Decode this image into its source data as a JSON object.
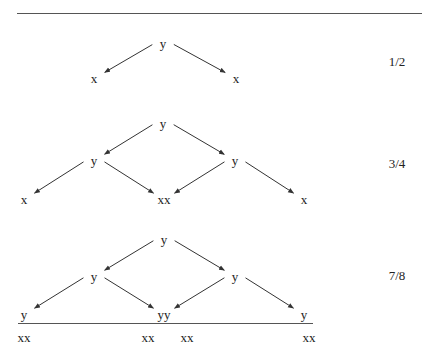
{
  "diagram": {
    "levels": [
      {
        "ratio": "1/2",
        "nodes": [
          {
            "id": "a0",
            "label": "y",
            "x": 163,
            "y": 43
          },
          {
            "id": "a1",
            "label": "x",
            "x": 94,
            "y": 78
          },
          {
            "id": "a2",
            "label": "x",
            "x": 236,
            "y": 78
          }
        ],
        "edges": [
          [
            "a0",
            "a1"
          ],
          [
            "a0",
            "a2"
          ]
        ]
      },
      {
        "ratio": "3/4",
        "nodes": [
          {
            "id": "b0",
            "label": "y",
            "x": 163,
            "y": 123
          },
          {
            "id": "b1",
            "label": "y",
            "x": 94,
            "y": 160
          },
          {
            "id": "b2",
            "label": "y",
            "x": 235,
            "y": 160
          },
          {
            "id": "b3",
            "label": "x",
            "x": 24,
            "y": 199
          },
          {
            "id": "b4",
            "label": "xx",
            "x": 164,
            "y": 199
          },
          {
            "id": "b5",
            "label": "x",
            "x": 304,
            "y": 199
          }
        ],
        "edges": [
          [
            "b0",
            "b1"
          ],
          [
            "b0",
            "b2"
          ],
          [
            "b1",
            "b3"
          ],
          [
            "b1",
            "b4"
          ],
          [
            "b2",
            "b4"
          ],
          [
            "b2",
            "b5"
          ]
        ]
      },
      {
        "ratio": "7/8",
        "nodes": [
          {
            "id": "c0",
            "label": "y",
            "x": 164,
            "y": 239
          },
          {
            "id": "c1",
            "label": "y",
            "x": 94,
            "y": 276
          },
          {
            "id": "c2",
            "label": "y",
            "x": 235,
            "y": 276
          },
          {
            "id": "c3",
            "label": "y",
            "x": 24,
            "y": 314
          },
          {
            "id": "c4",
            "label": "yy",
            "x": 164,
            "y": 314
          },
          {
            "id": "c5",
            "label": "y",
            "x": 304,
            "y": 314
          }
        ],
        "edges": [
          [
            "c0",
            "c1"
          ],
          [
            "c0",
            "c2"
          ],
          [
            "c1",
            "c3"
          ],
          [
            "c1",
            "c4"
          ],
          [
            "c2",
            "c4"
          ],
          [
            "c2",
            "c5"
          ]
        ]
      }
    ],
    "baseline_labels": [
      {
        "label": "xx",
        "x": 24,
        "y": 337
      },
      {
        "label": "xx",
        "x": 148,
        "y": 337
      },
      {
        "label": "xx",
        "x": 187,
        "y": 337
      },
      {
        "label": "xx",
        "x": 309,
        "y": 337
      }
    ],
    "ratio_positions": [
      {
        "x": 397,
        "y": 61
      },
      {
        "x": 397,
        "y": 163
      },
      {
        "x": 397,
        "y": 275
      }
    ]
  }
}
